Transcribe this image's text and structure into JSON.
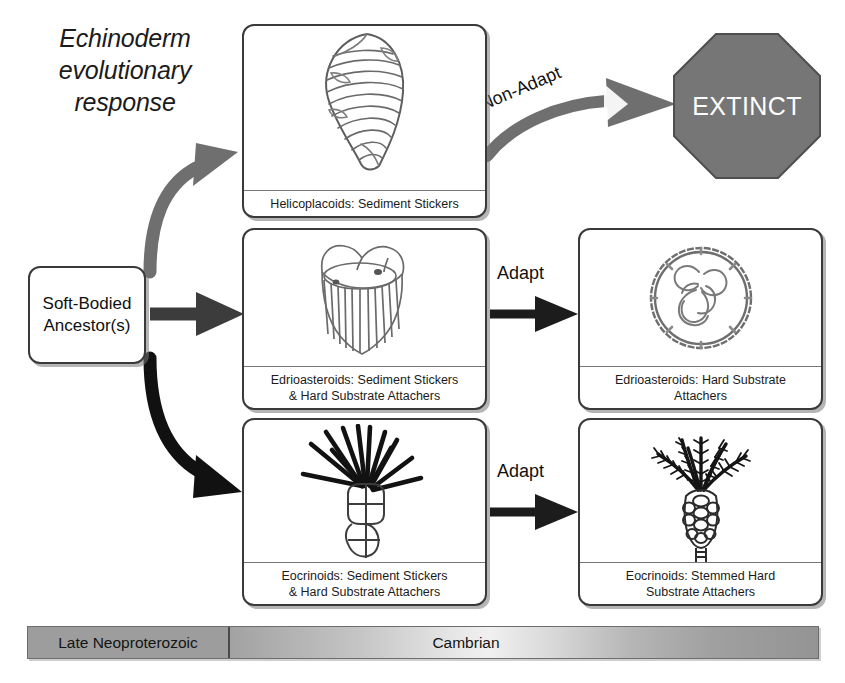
{
  "title": "Echinoderm\nevolutionary\nresponse",
  "ancestor": {
    "label": "Soft-Bodied\nAncestor(s)"
  },
  "extinct": {
    "label": "EXTINCT",
    "shape": "octagon",
    "fill_color": "#767676",
    "text_color": "#ffffff"
  },
  "arrow_labels": {
    "non_adapt": "Non-Adapt",
    "adapt_top": "Adapt",
    "adapt_bottom": "Adapt"
  },
  "boxes": [
    {
      "id": "helicoplacoids",
      "caption": "Helicoplacoids: Sediment Stickers",
      "art": "helicoplacoid-spiral-organism"
    },
    {
      "id": "edrioasteroids-left",
      "caption": "Edrioasteroids: Sediment Stickers\n& Hard Substrate Attachers",
      "art": "edrioasteroid-sediment-sticker-organism"
    },
    {
      "id": "eocrinoids-left",
      "caption": "Eocrinoids: Sediment Stickers\n& Hard Substrate Attachers",
      "art": "eocrinoid-sediment-sticker-organism"
    },
    {
      "id": "edrioasteroids-right",
      "caption": "Edrioasteroids: Hard Substrate\nAttachers",
      "art": "edrioasteroid-disc-organism"
    },
    {
      "id": "eocrinoids-right",
      "caption": "Eocrinoids: Stemmed Hard\nSubstrate Attachers",
      "art": "eocrinoid-stemmed-organism"
    }
  ],
  "timeline": {
    "segments": [
      {
        "label": "Late Neoproterozoic",
        "color": "#9d9d9d"
      },
      {
        "label": "Cambrian",
        "color": "#c9c9c9"
      }
    ]
  },
  "colors": {
    "box_border": "#3a3a3a",
    "arrow_gray": "#6f6f6f",
    "arrow_dark": "#3c3c3c",
    "arrow_black": "#111111",
    "background": "#ffffff"
  }
}
